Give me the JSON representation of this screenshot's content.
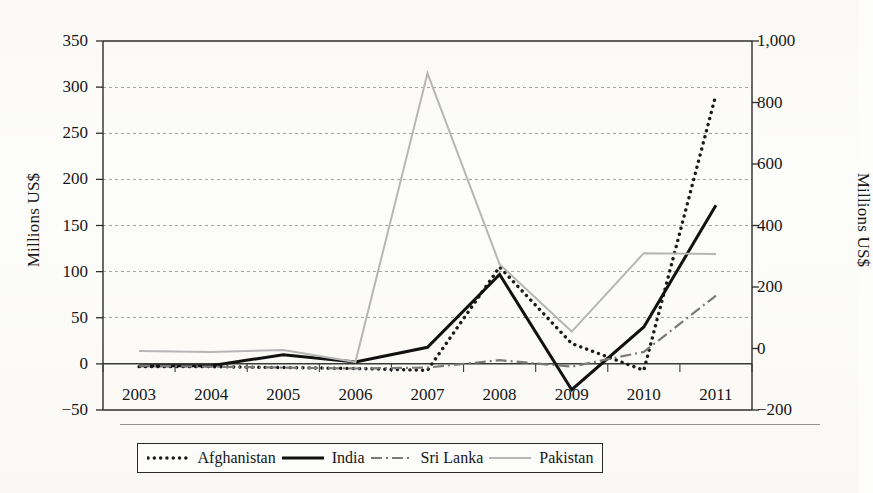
{
  "figure": {
    "background_color": "#fdfdfb",
    "plot_area": {
      "left": 103,
      "right": 752,
      "top": 41,
      "bottom": 410
    }
  },
  "axes": {
    "left": {
      "title": "Millions US$",
      "ticks": [
        "350",
        "300",
        "250",
        "200",
        "150",
        "100",
        "50",
        "0",
        "−50"
      ],
      "min": -50,
      "max": 350,
      "step": 50
    },
    "right": {
      "title": "Millions US$",
      "ticks": [
        "1,000",
        "800",
        "600",
        "400",
        "200",
        "0",
        "−200"
      ],
      "min": -200,
      "max": 1000,
      "step": 200
    },
    "x": {
      "ticks": [
        "2003",
        "2004",
        "2005",
        "2006",
        "2007",
        "2008",
        "2009",
        "2010",
        "2011"
      ]
    }
  },
  "legend": {
    "items": [
      {
        "label": "Afghanistan",
        "style": "dotted",
        "color": "#1b1b1b",
        "swatch": "dotted-line-swatch"
      },
      {
        "label": "India",
        "style": "solid-bold",
        "color": "#111111",
        "swatch": "solid-line-swatch"
      },
      {
        "label": "Sri Lanka",
        "style": "dash-dot",
        "color": "#6e6e6e",
        "swatch": "dash-dot-line-swatch"
      },
      {
        "label": "Pakistan",
        "style": "solid-light",
        "color": "#b4b4b4",
        "swatch": "light-line-swatch"
      }
    ]
  },
  "chart_data": {
    "type": "line",
    "title": "",
    "xlabel": "",
    "ylabel": "Millions US$",
    "y2label": "Millions US$",
    "x": [
      "2003",
      "2004",
      "2005",
      "2006",
      "2007",
      "2008",
      "2009",
      "2010",
      "2011"
    ],
    "ylim": [
      -50,
      350
    ],
    "y2lim": [
      -200,
      1000
    ],
    "grid": true,
    "grid_style": "dotted-horizontal",
    "legend_position": "bottom",
    "series": [
      {
        "name": "Afghanistan",
        "color": "#1b1b1b",
        "style": "dotted",
        "axis": "left",
        "values": [
          -3,
          -3,
          -4,
          -5,
          -7,
          105,
          22,
          -7,
          292
        ]
      },
      {
        "name": "India",
        "color": "#111111",
        "style": "solid-bold",
        "axis": "left",
        "values": [
          -2,
          -2,
          10,
          2,
          18,
          97,
          -28,
          40,
          172
        ]
      },
      {
        "name": "Sri Lanka",
        "color": "#6e6e6e",
        "style": "dash-dot",
        "axis": "left",
        "values": [
          -2,
          -3,
          -4,
          -5,
          -4,
          4,
          -3,
          13,
          74
        ]
      },
      {
        "name": "Pakistan",
        "color": "#b4b4b4",
        "style": "solid-light",
        "axis": "left",
        "values": [
          14,
          13,
          15,
          2,
          315,
          108,
          35,
          120,
          119
        ]
      }
    ]
  }
}
